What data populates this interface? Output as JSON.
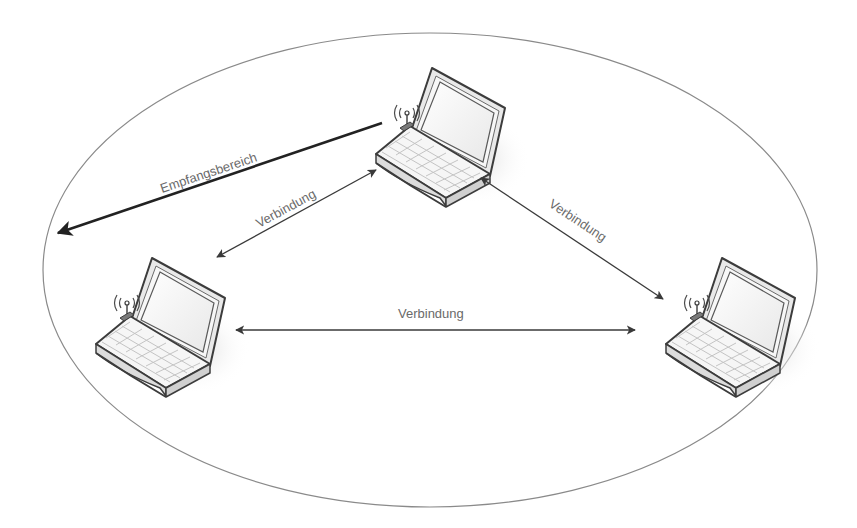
{
  "diagram": {
    "range_area": {
      "shape": "ellipse",
      "cx": 430,
      "cy": 270,
      "rx": 387,
      "ry": 237,
      "stroke_color": "#8a8a8a"
    },
    "nodes": [
      {
        "id": "laptop-top",
        "icon": "laptop-wifi-icon",
        "x": 370,
        "y": 64
      },
      {
        "id": "laptop-left",
        "icon": "laptop-wifi-icon",
        "x": 90,
        "y": 254
      },
      {
        "id": "laptop-right",
        "icon": "laptop-wifi-icon",
        "x": 660,
        "y": 254
      }
    ],
    "range_arrow": {
      "label": "Empfangsbereich",
      "from": [
        382,
        123
      ],
      "to": [
        55,
        234
      ],
      "color": "#222222"
    },
    "connections": [
      {
        "label": "Verbindung",
        "from": "laptop-top",
        "to": "laptop-left",
        "start": [
          376,
          170
        ],
        "end": [
          217,
          257
        ]
      },
      {
        "label": "Verbindung",
        "from": "laptop-top",
        "to": "laptop-right",
        "start": [
          481,
          178
        ],
        "end": [
          663,
          299
        ]
      },
      {
        "label": "Verbindung",
        "from": "laptop-left",
        "to": "laptop-right",
        "start": [
          236,
          330
        ],
        "end": [
          635,
          330
        ]
      }
    ],
    "colors": {
      "line": "#3a3a3a",
      "text": "#6a6a6a",
      "laptop_outline": "#3c3c3c",
      "laptop_fill": "#f4f4f4",
      "screen_fill": "#fafafa",
      "shadow": "#e6e6e6"
    }
  }
}
